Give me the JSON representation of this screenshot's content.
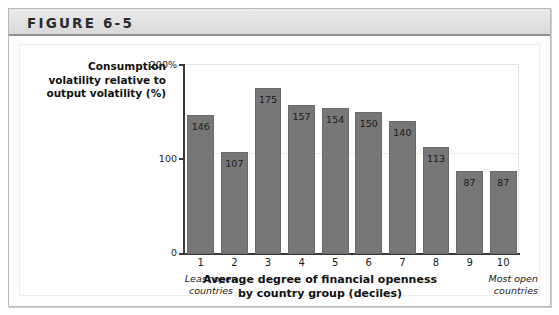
{
  "figure": {
    "header_title": "FIGURE 6-5"
  },
  "chart_data": {
    "type": "bar",
    "title": "",
    "categories": [
      "1",
      "2",
      "3",
      "4",
      "5",
      "6",
      "7",
      "8",
      "9",
      "10"
    ],
    "values": [
      146,
      107,
      175,
      157,
      154,
      150,
      140,
      113,
      87,
      87
    ],
    "ylabel_lines": [
      "Consumption",
      "volatility relative to",
      "output volatility (%)"
    ],
    "xlabel_lines": [
      "Average degree of financial openness",
      "by country group (deciles)"
    ],
    "ylim": [
      0,
      200
    ],
    "yticks": [
      "0",
      "100",
      "200%"
    ],
    "ytick_values": [
      0,
      100,
      200
    ],
    "grid": true,
    "legend": "none",
    "annotations": {
      "left_caption_lines": [
        "Least open",
        "countries"
      ],
      "right_caption_lines": [
        "Most open",
        "countries"
      ]
    },
    "colors": {
      "bar_fill": "#777777",
      "bar_stroke": "#6a6a6a",
      "axis": "#3a3a3a",
      "grid": "#ececec",
      "header_band": "#e2e2e2"
    }
  }
}
